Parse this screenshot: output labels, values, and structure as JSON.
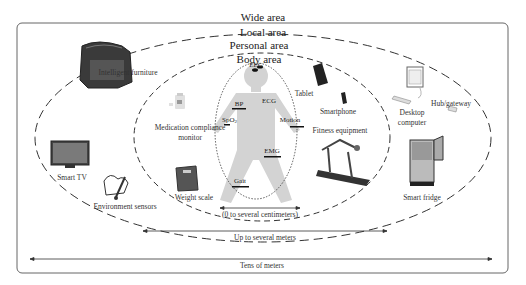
{
  "diagram": {
    "areas": {
      "wide": "Wide area",
      "local": "Local area",
      "personal": "Personal area",
      "body": "Body area"
    },
    "body_sensors": {
      "eeg": "EEG",
      "ecg": "ECG",
      "bp": "BP",
      "spo2_main": "SpO",
      "spo2_sub": "2",
      "motion": "Motion",
      "emg": "EMG",
      "gait": "Gait"
    },
    "personal_devices": {
      "medication": "Medication compliance",
      "medication_line2": "monitor",
      "weight_scale": "Weight scale",
      "tablet": "Tablet",
      "smartphone": "Smartphone",
      "fitness": "Fitness equipment"
    },
    "local_devices": {
      "furniture": "Intelligent furniture",
      "smart_tv": "Smart TV",
      "env_sensors": "Environment sensors",
      "desktop": "Desktop",
      "desktop_line2": "computer",
      "hub": "Hub/gateway",
      "fridge": "Smart fridge"
    },
    "ranges": {
      "body": "(0 to several centimeters)",
      "personal": "Up to several meters",
      "wide": "Tens of meters"
    },
    "colors": {
      "line": "#333333",
      "body_silhouette": "#d3d3d3",
      "frame": "#666666"
    }
  }
}
